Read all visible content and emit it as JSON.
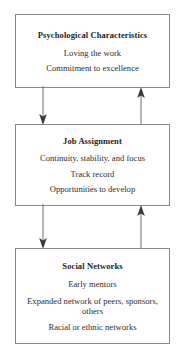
{
  "diagram": {
    "type": "flow-diagram",
    "orientation": "vertical",
    "boxes": [
      {
        "id": "psychological",
        "title": "Psychological Characteristics",
        "lines": [
          "Loving the work",
          "Commitment to excellence"
        ]
      },
      {
        "id": "job",
        "title": "Job Assignment",
        "lines": [
          "Continuity, stability, and focus",
          "Track record",
          "Opportunities to develop"
        ]
      },
      {
        "id": "social",
        "title": "Social Networks",
        "lines": [
          "Early mentors",
          "Expanded network of peers, sponsors, others",
          "Racial or ethnic networks"
        ]
      }
    ],
    "connectors": [
      {
        "id": "psych-to-job",
        "from": "psychological",
        "to": "job",
        "direction": "down",
        "side": "left"
      },
      {
        "id": "job-to-psych",
        "from": "job",
        "to": "psychological",
        "direction": "up",
        "side": "right"
      },
      {
        "id": "job-to-social",
        "from": "job",
        "to": "social",
        "direction": "down",
        "side": "left"
      },
      {
        "id": "social-to-job",
        "from": "social",
        "to": "job",
        "direction": "up",
        "side": "right"
      }
    ]
  },
  "colors": {
    "box_border": "#8a8a8a",
    "arrow_line": "#6f6f6f",
    "arrow_head": "#3a3a3a",
    "text": "#2b2b2b",
    "background": "#ffffff"
  }
}
